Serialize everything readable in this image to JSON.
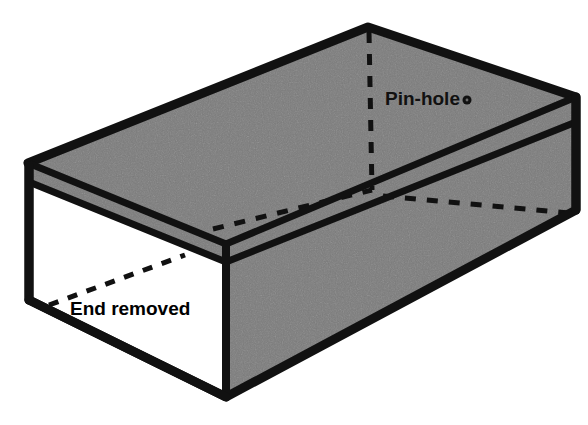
{
  "figure": {
    "background_color": "#ffffff",
    "ink_color": "#111111",
    "fill_gray": "#7b7b7b",
    "interior_white": "#ffffff",
    "labels": {
      "pin_hole": "Pin-hole",
      "end_removed": "End removed"
    },
    "markers": {
      "pin_hole_dot": "pin-hole-dot"
    },
    "leaders": {
      "pin_hole_vertical": "dashed vertical hidden edge from back top corner",
      "end_removed_arrow": "dashed leader pointing to removed end opening",
      "hidden_bottom_back": "dashed hidden bottom rear edge"
    }
  }
}
